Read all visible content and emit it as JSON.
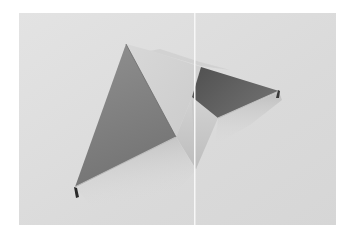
{
  "image": {
    "description": "Grayscale photograph of a folded paper sculpture of triangular planes on a light gray background, split by a white vertical gutter line",
    "colors": {
      "page_background": "#ffffff",
      "photo_background": "#dcdcdc",
      "photo_background_light": "#e6e6e6",
      "gutter_line": "#f7f7f7",
      "big_triangle_top": "#8a8a8a",
      "big_triangle_bottom": "#6e6e6e",
      "light_flap": "#d3d3d3",
      "light_kite": "#cfcfcf",
      "dark_quad": "#5a5a5a",
      "dark_quad_light": "#7a7a7a",
      "edge_highlight": "#b8b8b8",
      "shadow": "#bdbdbd",
      "fold_edge_dark": "#2a2a2a"
    }
  }
}
